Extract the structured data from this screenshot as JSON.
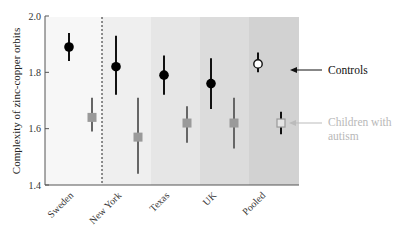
{
  "chart_data": {
    "type": "scatter",
    "title": "",
    "xlabel": "",
    "ylabel": "Complexity of zinc-copper orbits",
    "ylim": [
      1.4,
      2.0
    ],
    "yticks": [
      1.4,
      1.6,
      1.8,
      2.0
    ],
    "ytick_labels": [
      "1.4",
      "1.6",
      "1.8",
      "2.0"
    ],
    "categories": [
      "Sweden",
      "New York",
      "Texas",
      "UK",
      "Pooled"
    ],
    "grid": false,
    "series": [
      {
        "name": "Controls",
        "marker": "filled-circle (open circle for Pooled)",
        "color": "#000000",
        "values": [
          1.89,
          1.82,
          1.79,
          1.76,
          1.83
        ],
        "error_low": [
          1.84,
          1.72,
          1.72,
          1.67,
          1.8
        ],
        "error_high": [
          1.94,
          1.93,
          1.86,
          1.85,
          1.87
        ]
      },
      {
        "name": "Children with autism",
        "marker": "filled-square (open square for Pooled)",
        "color": "#999999",
        "values": [
          1.64,
          1.57,
          1.62,
          1.62,
          1.62
        ],
        "error_low": [
          1.59,
          1.44,
          1.55,
          1.53,
          1.58
        ],
        "error_high": [
          1.71,
          1.71,
          1.68,
          1.71,
          1.66
        ]
      }
    ],
    "annotations": [
      {
        "text": "Controls",
        "arrow_to": "Pooled controls marker"
      },
      {
        "text": "Children with autism",
        "arrow_to": "Pooled autism marker"
      }
    ],
    "separator": "dashed vertical line between Sweden and New York",
    "band_colors": [
      "#f7f7f7",
      "#efefef",
      "#e6e6e6",
      "#dcdcdc",
      "#d2d2d2"
    ],
    "legend_position": "right, as arrow annotations"
  },
  "labels": {
    "ylabel": "Complexity of zinc-copper orbits",
    "legend_controls": "Controls",
    "legend_autism_line1": "Children with",
    "legend_autism_line2": "autism",
    "categories": [
      "Sweden",
      "New York",
      "Texas",
      "UK",
      "Pooled"
    ],
    "yticks": [
      "1.4",
      "1.6",
      "1.8",
      "2.0"
    ]
  }
}
